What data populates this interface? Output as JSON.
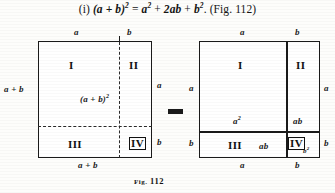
{
  "heading": {
    "item_number": "(i)",
    "formula_text": "(a + b)² = a² + 2ab + b². (Fig. 112)",
    "lhs": "(a + b)",
    "lhs_exp": "2",
    "eq": "=",
    "t1": "a",
    "t1_exp": "2",
    "plus1": "+",
    "t2": "2ab",
    "plus2": "+",
    "t3": "b",
    "t3_exp": "2",
    "period": ".",
    "ref": "(Fig. 112)"
  },
  "operator": {
    "symbol": "=",
    "name": "equals-sign"
  },
  "left_figure": {
    "name": "square-of-sum-whole",
    "top_labels": [
      "a",
      "b"
    ],
    "left_label": "a + b",
    "right_labels": [
      "a",
      "b"
    ],
    "bottom_label": "a + b",
    "regions": [
      "I",
      "II",
      "III",
      "IV"
    ],
    "area_label": "(a + b)",
    "area_label_exp": "2",
    "line_style": "dashed"
  },
  "right_figure": {
    "name": "square-of-sum-decomposed",
    "top_labels": [
      "a",
      "b"
    ],
    "left_labels": [
      "a",
      "b"
    ],
    "right_labels": [
      "a",
      "b"
    ],
    "bottom_labels": [
      "a",
      "b"
    ],
    "regions": [
      "I",
      "II",
      "III",
      "IV"
    ],
    "area_labels": {
      "region_I": "a",
      "region_I_exp": "2",
      "region_II": "ab",
      "region_III": "ab",
      "region_IV": "b",
      "region_IV_exp": "2"
    },
    "line_style": "solid"
  },
  "caption": {
    "prefix": "Fig.",
    "number": "112",
    "full": "FIG. 112"
  },
  "colors": {
    "ink": "#1a1a1a",
    "paper": "#fdfdfb"
  }
}
